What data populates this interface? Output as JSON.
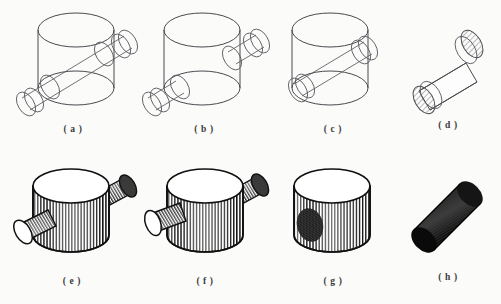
{
  "figure": {
    "background_color": "#fbfbfa",
    "ink_color": "#111111",
    "wireframe_color": "#4a4a4f",
    "rows": 2,
    "columns": 4
  },
  "panels": [
    {
      "id": "a",
      "caption": "( a )",
      "row": "top",
      "kind": "wireframe",
      "content": "Upright main cylinder with a long thin cylinder passing diagonally all the way through it, protruding at the upper right and the lower left."
    },
    {
      "id": "b",
      "caption": "( b )",
      "row": "top",
      "kind": "wireframe",
      "content": "Upright main cylinder with two short stub cylinders attached on opposite sides, upper right and lower left."
    },
    {
      "id": "c",
      "caption": "( c )",
      "row": "top",
      "kind": "wireframe",
      "content": "Upright main cylinder enclosing a single diagonal cylinder that terminates inside the body."
    },
    {
      "id": "d",
      "caption": "( d )",
      "row": "top",
      "kind": "wireframe",
      "content": "Isolated diagonal cylinder alone, with hatched elliptical caps at both ends."
    },
    {
      "id": "e",
      "caption": "( e )",
      "row": "bottom",
      "kind": "shaded",
      "content": "Shaded solid cylinder with vertical line hatching and two protruding branch cylinders, upper right and lower left."
    },
    {
      "id": "f",
      "caption": "( f )",
      "row": "bottom",
      "kind": "shaded",
      "content": "Shaded solid cylinder with vertical hatching and two branch cylinders, the left branch attached higher on the body."
    },
    {
      "id": "g",
      "caption": "( g )",
      "row": "bottom",
      "kind": "shaded",
      "content": "Shaded solid cylinder with vertical hatching and a dark elliptical cross-hatched patch on the lower left where a branch was removed."
    },
    {
      "id": "h",
      "caption": "( h )",
      "row": "bottom",
      "kind": "shaded",
      "content": "Isolated diagonal cylinder rendered nearly solid black with fine longitudinal hatching."
    }
  ]
}
